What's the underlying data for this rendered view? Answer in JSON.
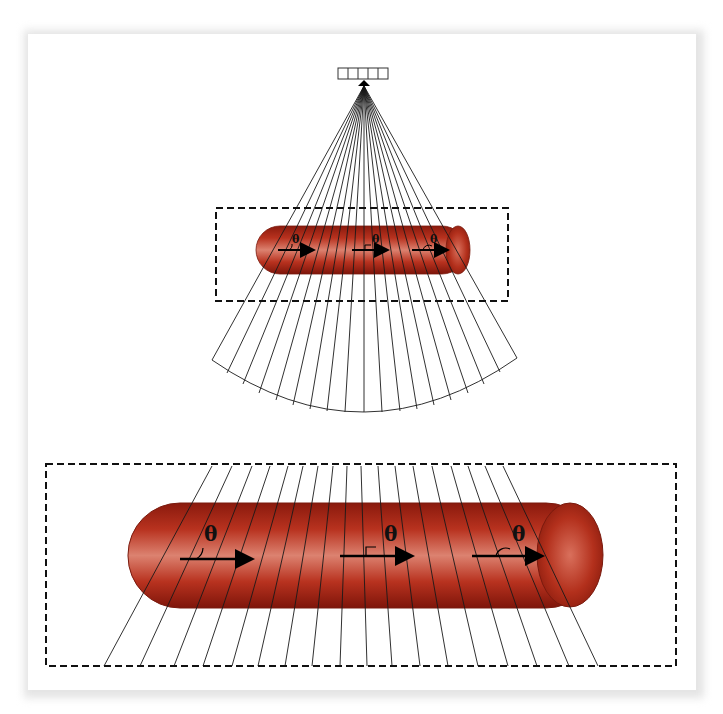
{
  "figure": {
    "transducer": {
      "elements": 5
    },
    "fan": {
      "line_count": 23
    },
    "top_panel": {
      "angle_labels": [
        "θ",
        "θ",
        "θ"
      ],
      "angle_types": [
        "acute",
        "right",
        "obtuse"
      ]
    },
    "bottom_panel": {
      "title": "Zoomed view of vessel",
      "angle_labels": [
        "θ",
        "θ",
        "θ"
      ],
      "angle_types": [
        "acute",
        "right",
        "obtuse"
      ]
    },
    "colors": {
      "vessel_dark": "#8e1a0c",
      "vessel_mid": "#c0392b",
      "vessel_light": "#e08a7a",
      "line": "#1a1a1a",
      "dash": "#111111"
    }
  }
}
